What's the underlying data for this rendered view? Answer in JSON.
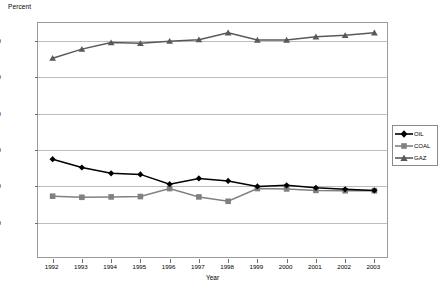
{
  "chart_data": {
    "type": "line",
    "title": "",
    "subtitle": "",
    "xlabel": "Year",
    "ylabel": "Percent",
    "ylabel_position": "top-left",
    "grid": true,
    "legend_position": "right",
    "xlim": [
      "1992",
      "2003"
    ],
    "ylim": [
      0,
      65
    ],
    "ytick_labels": [
      "10.0",
      "20.0",
      "30.0",
      "40.0",
      "50.0",
      "60.0"
    ],
    "ytick_values": [
      10,
      20,
      30,
      40,
      50,
      60
    ],
    "categories": [
      "1992",
      "1993",
      "1994",
      "1995",
      "1996",
      "1997",
      "1998",
      "1999",
      "2000",
      "2001",
      "2002",
      "2003"
    ],
    "series": [
      {
        "name": "OIL",
        "marker": "diamond",
        "color": "#000000",
        "values": [
          27.5,
          25.2,
          23.6,
          23.3,
          20.6,
          22.2,
          21.5,
          20.0,
          20.3,
          19.6,
          19.2,
          18.9
        ]
      },
      {
        "name": "COAL",
        "marker": "square",
        "color": "#808080",
        "values": [
          17.3,
          17.0,
          17.1,
          17.2,
          19.4,
          17.1,
          15.9,
          19.4,
          19.3,
          18.9,
          18.8,
          18.8
        ]
      },
      {
        "name": "GAZ",
        "marker": "triangle",
        "color": "#595959",
        "values": [
          55.3,
          57.8,
          59.6,
          59.4,
          60.0,
          60.4,
          62.3,
          60.3,
          60.3,
          61.2,
          61.6,
          62.3
        ]
      }
    ]
  },
  "legend": {
    "entries": [
      {
        "label": "OIL"
      },
      {
        "label": "COAL"
      },
      {
        "label": "GAZ"
      }
    ]
  },
  "axes": {
    "y_title": "Percent",
    "x_title": "Year"
  }
}
